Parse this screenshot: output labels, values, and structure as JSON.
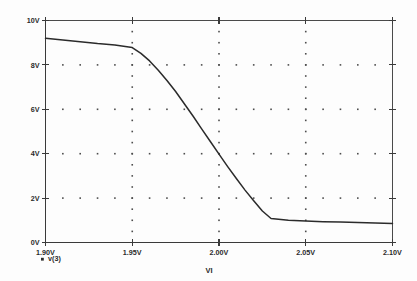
{
  "chart_data": {
    "type": "line",
    "title": "",
    "xlabel": "VI",
    "ylabel": "",
    "xlim": [
      1.9,
      2.1
    ],
    "ylim": [
      0,
      10
    ],
    "grid": true,
    "grid_style": "dotted",
    "legend_position": "below-left",
    "x_tick_labels": [
      "1.90V",
      "1.95V",
      "2.00V",
      "2.05V",
      "2.10V"
    ],
    "x_tick_values": [
      1.9,
      1.95,
      2.0,
      2.05,
      2.1
    ],
    "y_tick_labels": [
      "0V",
      "2V",
      "4V",
      "6V",
      "8V",
      "10V"
    ],
    "y_tick_values": [
      0,
      2,
      4,
      6,
      8,
      10
    ],
    "series": [
      {
        "name": "v(3)",
        "marker": "square",
        "color": "#2b2b2b",
        "x": [
          1.9,
          1.91,
          1.92,
          1.93,
          1.94,
          1.95,
          1.955,
          1.96,
          1.965,
          1.97,
          1.975,
          1.98,
          1.985,
          1.99,
          1.995,
          2.0,
          2.005,
          2.01,
          2.015,
          2.02,
          2.025,
          2.03,
          2.04,
          2.05,
          2.06,
          2.07,
          2.08,
          2.09,
          2.1
        ],
        "y": [
          9.2,
          9.12,
          9.04,
          8.96,
          8.9,
          8.78,
          8.52,
          8.18,
          7.76,
          7.3,
          6.8,
          6.25,
          5.7,
          5.12,
          4.55,
          3.98,
          3.42,
          2.88,
          2.36,
          1.88,
          1.42,
          1.08,
          1.0,
          0.97,
          0.94,
          0.92,
          0.9,
          0.88,
          0.86
        ]
      }
    ]
  },
  "legend": {
    "entries": [
      {
        "marker_name": "legend-marker-square",
        "label": "v(3)"
      }
    ]
  },
  "axes": {
    "x_axis_title": "VI",
    "y_axis_title": ""
  }
}
